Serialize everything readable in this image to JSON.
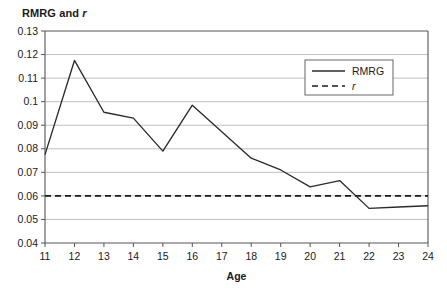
{
  "chart_data": {
    "type": "line",
    "title": "RMRG and r",
    "title_plain": "RMRG and ",
    "title_italic": "r",
    "xlabel": "Age",
    "ylabel": "",
    "x": [
      11,
      12,
      13,
      14,
      15,
      16,
      17,
      18,
      19,
      20,
      21,
      22,
      23,
      24
    ],
    "xtick_labels": [
      "11",
      "12",
      "13",
      "14",
      "15",
      "16",
      "17",
      "18",
      "19",
      "20",
      "21",
      "22",
      "23",
      "24"
    ],
    "xlim": [
      11,
      24
    ],
    "ylim": [
      0.04,
      0.13
    ],
    "ytick_values": [
      0.04,
      0.05,
      0.06,
      0.07,
      0.08,
      0.09,
      0.1,
      0.11,
      0.12,
      0.13
    ],
    "ytick_labels": [
      "0.04",
      "0.05",
      "0.06",
      "0.07",
      "0.08",
      "0.09",
      "0.1",
      "0.11",
      "0.12",
      "0.13"
    ],
    "grid": "horizontal",
    "legend_position": "upper-right",
    "series": [
      {
        "name": "RMRG",
        "style": "solid",
        "color": "#2b2b2b",
        "values": [
          0.0775,
          0.1175,
          0.0955,
          0.093,
          0.079,
          0.0985,
          0.0872,
          0.076,
          0.071,
          0.0638,
          0.0665,
          0.0547,
          0.0553,
          0.0558
        ]
      },
      {
        "name": "r",
        "style": "dashed",
        "color": "#1a1a1a",
        "constant": 0.06,
        "values": [
          0.06,
          0.06,
          0.06,
          0.06,
          0.06,
          0.06,
          0.06,
          0.06,
          0.06,
          0.06,
          0.06,
          0.06,
          0.06,
          0.06
        ]
      }
    ],
    "legend": [
      {
        "label": "RMRG",
        "style": "solid",
        "italic": false
      },
      {
        "label": "r",
        "style": "dashed",
        "italic": true
      }
    ]
  },
  "layout": {
    "plot_left": 45,
    "plot_right": 428,
    "plot_top": 31,
    "plot_bottom": 243,
    "legend_x": 305,
    "legend_y": 60,
    "legend_w": 88,
    "legend_h": 35
  }
}
